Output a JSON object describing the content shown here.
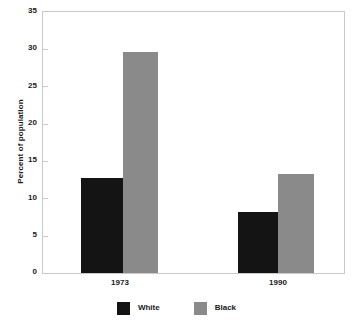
{
  "chart_data": {
    "type": "bar",
    "title": "",
    "subtitle": "",
    "xlabel": "",
    "ylabel": "Percent of population",
    "categories": [
      "1973",
      "1990"
    ],
    "series": [
      {
        "name": "White",
        "color": "#141414",
        "values": [
          12.8,
          8.2
        ]
      },
      {
        "name": "Black",
        "color": "#8a8a8a",
        "values": [
          29.7,
          13.3
        ]
      }
    ],
    "ylim": [
      0,
      35
    ],
    "ytick_step": 5,
    "yticks": [
      "0",
      "5",
      "10",
      "15",
      "20",
      "25",
      "30",
      "35"
    ],
    "grid": false,
    "legend_position": "bottom",
    "annotations": []
  },
  "axis": {
    "y_title": "Percent of population",
    "y_ticks": [
      {
        "value": 35,
        "label": "35"
      },
      {
        "value": 30,
        "label": "30"
      },
      {
        "value": 25,
        "label": "25"
      },
      {
        "value": 20,
        "label": "20"
      },
      {
        "value": 15,
        "label": "15"
      },
      {
        "value": 10,
        "label": "10"
      },
      {
        "value": 5,
        "label": "5"
      },
      {
        "value": 0,
        "label": "0"
      }
    ],
    "x_ticks": [
      {
        "label": "1973"
      },
      {
        "label": "1990"
      }
    ]
  },
  "legend": {
    "entries": [
      {
        "label": "White",
        "color": "#141414"
      },
      {
        "label": "Black",
        "color": "#8a8a8a"
      }
    ]
  },
  "colors": {
    "white_series": "#141414",
    "black_series": "#8a8a8a",
    "frame": "#c9c9c9",
    "text": "#1a1a1a",
    "background": "#ffffff"
  }
}
